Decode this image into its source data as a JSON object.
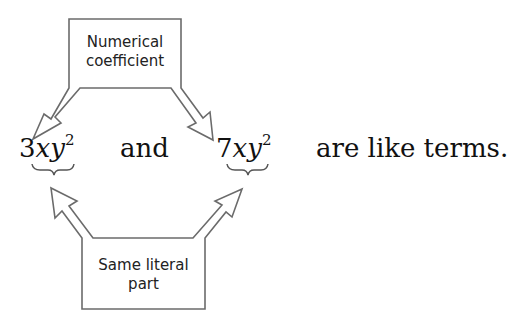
{
  "diagram": {
    "top_box": {
      "line1": "Numerical",
      "line2": "coefficient"
    },
    "bottom_box": {
      "line1": "Same literal",
      "line2": "part"
    },
    "term1": {
      "coefficient": "3",
      "var1": "x",
      "var2": "y",
      "exponent": "2"
    },
    "connector": "and",
    "term2": {
      "coefficient": "7",
      "var1": "x",
      "var2": "y",
      "exponent": "2"
    },
    "conclusion": "are like terms."
  },
  "colors": {
    "stroke": "#6b6b6b",
    "text": "#111111",
    "background": "#ffffff"
  }
}
